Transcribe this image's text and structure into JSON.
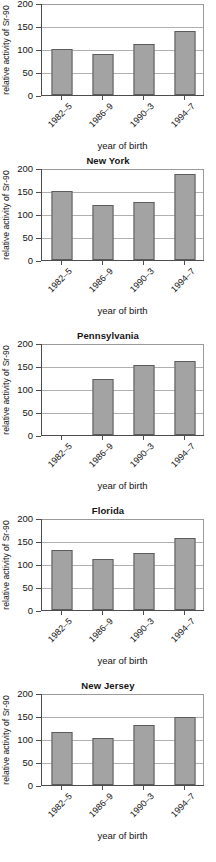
{
  "figure": {
    "shared": {
      "ylabel": "relative activity of Sr-90",
      "xlabel": "year of birth",
      "categories": [
        "1982–5",
        "1986–9",
        "1990–3",
        "1994–7"
      ],
      "yticks": [
        "0",
        "50",
        "100",
        "150",
        "200"
      ],
      "ylim": [
        0,
        200
      ],
      "bar_color": "#a3a3a3",
      "bar_border_color": "#5c5c5c",
      "axis_color": "#4d4d4d",
      "grid_color": "#b0b0b0"
    },
    "panels": [
      {
        "title": "",
        "values": [
          101,
          90,
          110,
          140
        ]
      },
      {
        "title": "New York",
        "values": [
          150,
          120,
          127,
          186
        ]
      },
      {
        "title": "Pennsylvania",
        "values": [
          null,
          122,
          152,
          160
        ]
      },
      {
        "title": "Florida",
        "values": [
          130,
          110,
          125,
          156
        ]
      },
      {
        "title": "New Jersey",
        "values": [
          115,
          102,
          131,
          147
        ]
      }
    ]
  },
  "chart_data": [
    {
      "type": "bar",
      "title": "",
      "categories": [
        "1982–5",
        "1986–9",
        "1990–3",
        "1994–7"
      ],
      "values": [
        101,
        90,
        110,
        140
      ],
      "xlabel": "year of birth",
      "ylabel": "relative activity of Sr-90",
      "ylim": [
        0,
        200
      ],
      "yticks": [
        0,
        50,
        100,
        150,
        200
      ],
      "grid": true,
      "legend": "none"
    },
    {
      "type": "bar",
      "title": "New York",
      "categories": [
        "1982–5",
        "1986–9",
        "1990–3",
        "1994–7"
      ],
      "values": [
        150,
        120,
        127,
        186
      ],
      "xlabel": "year of birth",
      "ylabel": "relative activity of Sr-90",
      "ylim": [
        0,
        200
      ],
      "yticks": [
        0,
        50,
        100,
        150,
        200
      ],
      "grid": true,
      "legend": "none"
    },
    {
      "type": "bar",
      "title": "Pennsylvania",
      "categories": [
        "1982–5",
        "1986–9",
        "1990–3",
        "1994–7"
      ],
      "values": [
        null,
        122,
        152,
        160
      ],
      "xlabel": "year of birth",
      "ylabel": "relative activity of Sr-90",
      "ylim": [
        0,
        200
      ],
      "yticks": [
        0,
        50,
        100,
        150,
        200
      ],
      "grid": true,
      "legend": "none"
    },
    {
      "type": "bar",
      "title": "Florida",
      "categories": [
        "1982–5",
        "1986–9",
        "1990–3",
        "1994–7"
      ],
      "values": [
        130,
        110,
        125,
        156
      ],
      "xlabel": "year of birth",
      "ylabel": "relative activity of Sr-90",
      "ylim": [
        0,
        200
      ],
      "yticks": [
        0,
        50,
        100,
        150,
        200
      ],
      "grid": true,
      "legend": "none"
    },
    {
      "type": "bar",
      "title": "New Jersey",
      "categories": [
        "1982–5",
        "1986–9",
        "1990–3",
        "1994–7"
      ],
      "values": [
        115,
        102,
        131,
        147
      ],
      "xlabel": "year of birth",
      "ylabel": "relative activity of Sr-90",
      "ylim": [
        0,
        200
      ],
      "yticks": [
        0,
        50,
        100,
        150,
        200
      ],
      "grid": true,
      "legend": "none"
    }
  ]
}
